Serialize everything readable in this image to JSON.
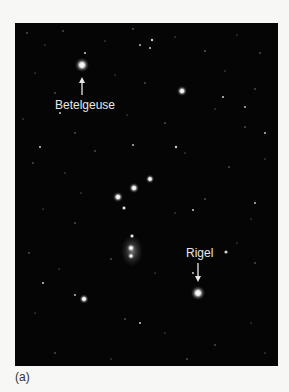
{
  "figure": {
    "caption": "(a)",
    "background_color": "#050505",
    "labels": [
      {
        "text": "Betelgeuse",
        "star": "Betelgeuse"
      },
      {
        "text": "Rigel",
        "star": "Rigel"
      }
    ]
  }
}
